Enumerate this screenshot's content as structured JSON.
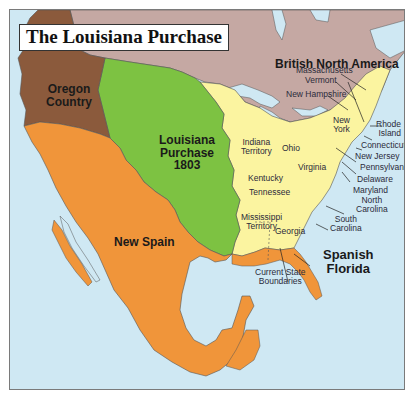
{
  "title": "The Louisiana Purchase",
  "colors": {
    "water": "#cfe8f3",
    "british_north_america": "#c5a8a3",
    "oregon_country": "#8b5a3c",
    "louisiana_purchase": "#7dc242",
    "new_spain": "#f0953a",
    "united_states": "#fbf4a0",
    "border": "#333333"
  },
  "regions": {
    "british_north_america": "British North America",
    "oregon_country_line1": "Oregon",
    "oregon_country_line2": "Country",
    "louisiana_line1": "Louisiana",
    "louisiana_line2": "Purchase",
    "louisiana_year": "1803",
    "new_spain": "New Spain",
    "spanish_florida_line1": "Spanish",
    "spanish_florida_line2": "Florida"
  },
  "states": {
    "massachusetts": "Massachusetts",
    "vermont": "Vermont",
    "new_hampshire": "New Hampshire",
    "new_york_line1": "New",
    "new_york_line2": "York",
    "rhode_island_line1": "Rhode",
    "rhode_island_line2": "Island",
    "connecticut": "Connecticut",
    "new_jersey": "New Jersey",
    "pennsylvania": "Pennsylvania",
    "delaware": "Delaware",
    "maryland": "Maryland",
    "north_carolina_line1": "North",
    "north_carolina_line2": "Carolina",
    "south_carolina_line1": "South",
    "south_carolina_line2": "Carolina",
    "georgia": "Georgia",
    "virginia": "Virginia",
    "kentucky": "Kentucky",
    "tennessee": "Tennessee",
    "ohio": "Ohio",
    "indiana_line1": "Indiana",
    "indiana_line2": "Territory",
    "mississippi_line1": "Mississippi",
    "mississippi_line2": "Territory"
  },
  "legend_note": {
    "line1": "Current State",
    "line2": "Boundaries"
  }
}
